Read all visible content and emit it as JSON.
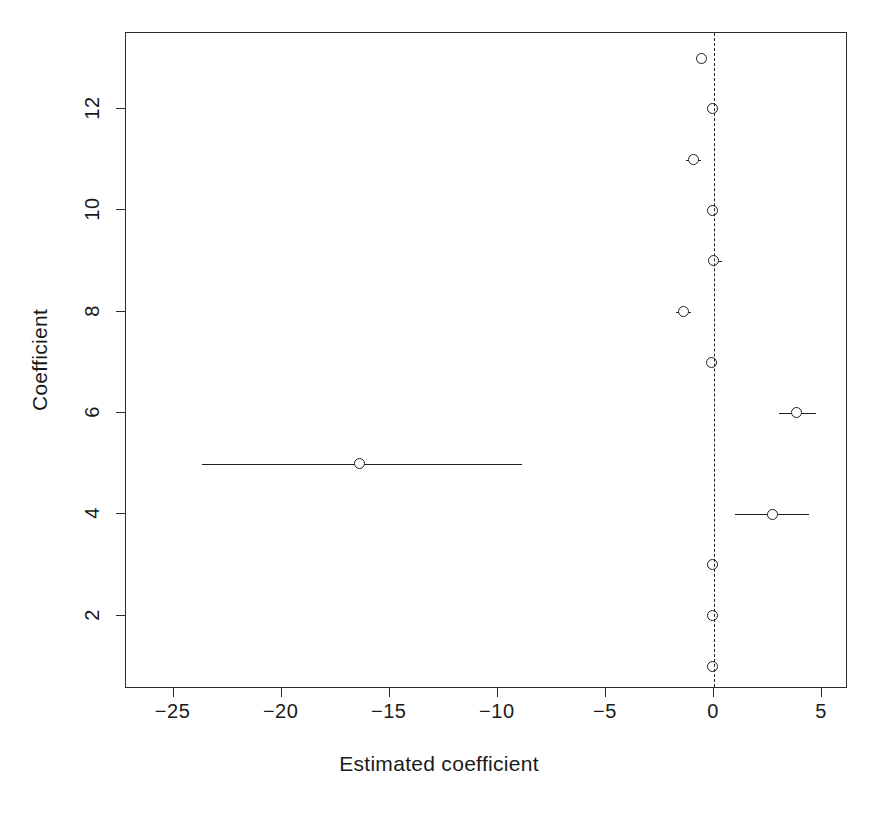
{
  "chart_data": {
    "type": "scatter",
    "title": "",
    "subtitle": "",
    "xlabel": "Estimated coefficient",
    "ylabel": "Coefficient",
    "xlim": [
      -27.2,
      6.2
    ],
    "ylim": [
      0.55,
      13.5
    ],
    "xticks": [
      -25,
      -20,
      -15,
      -10,
      -5,
      0,
      5
    ],
    "xtick_labels": [
      "−25",
      "−20",
      "−15",
      "−10",
      "−5",
      "0",
      "5"
    ],
    "yticks": [
      2,
      4,
      6,
      8,
      10,
      12
    ],
    "ytick_labels": [
      "2",
      "4",
      "6",
      "8",
      "10",
      "12"
    ],
    "grid": false,
    "legend": null,
    "reference_line": {
      "orientation": "vertical",
      "value": 0,
      "style": "dashed",
      "color": "#1f1f1f"
    },
    "marker": {
      "shape": "circle-open",
      "color": "#1f1f1f",
      "fill": "none"
    },
    "series": [
      {
        "name": "Estimated coefficient with confidence interval",
        "orientation": "horizontal",
        "points": [
          {
            "y": 1,
            "estimate": -0.05,
            "low": -0.25,
            "high": 0.15
          },
          {
            "y": 2,
            "estimate": -0.05,
            "low": -0.25,
            "high": 0.15
          },
          {
            "y": 3,
            "estimate": -0.05,
            "low": -0.3,
            "high": 0.2
          },
          {
            "y": 4,
            "estimate": 2.7,
            "low": 0.96,
            "high": 4.4
          },
          {
            "y": 5,
            "estimate": -16.4,
            "low": -23.7,
            "high": -8.9
          },
          {
            "y": 6,
            "estimate": 3.8,
            "low": 3.0,
            "high": 4.7
          },
          {
            "y": 7,
            "estimate": -0.1,
            "low": -0.35,
            "high": 0.15
          },
          {
            "y": 8,
            "estimate": -1.4,
            "low": -1.75,
            "high": -1.05
          },
          {
            "y": 9,
            "estimate": 0.0,
            "low": -0.2,
            "high": 0.35
          },
          {
            "y": 10,
            "estimate": -0.05,
            "low": -0.25,
            "high": 0.15
          },
          {
            "y": 11,
            "estimate": -0.96,
            "low": -1.3,
            "high": -0.6
          },
          {
            "y": 12,
            "estimate": -0.05,
            "low": -0.25,
            "high": 0.2
          },
          {
            "y": 13,
            "estimate": -0.57,
            "low": -0.85,
            "high": -0.3
          }
        ]
      }
    ]
  }
}
